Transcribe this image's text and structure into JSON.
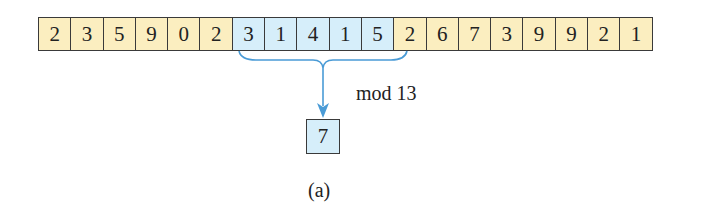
{
  "digits": [
    "2",
    "3",
    "5",
    "9",
    "0",
    "2",
    "3",
    "1",
    "4",
    "1",
    "5",
    "2",
    "6",
    "7",
    "3",
    "9",
    "9",
    "2",
    "1"
  ],
  "window": {
    "start": 6,
    "end": 10
  },
  "operation_label": "mod 13",
  "result": "7",
  "caption": "(a)",
  "colors": {
    "normal_cell": "#fbeec0",
    "window_cell": "#d6eefa",
    "arrow": "#4a9bd6"
  }
}
